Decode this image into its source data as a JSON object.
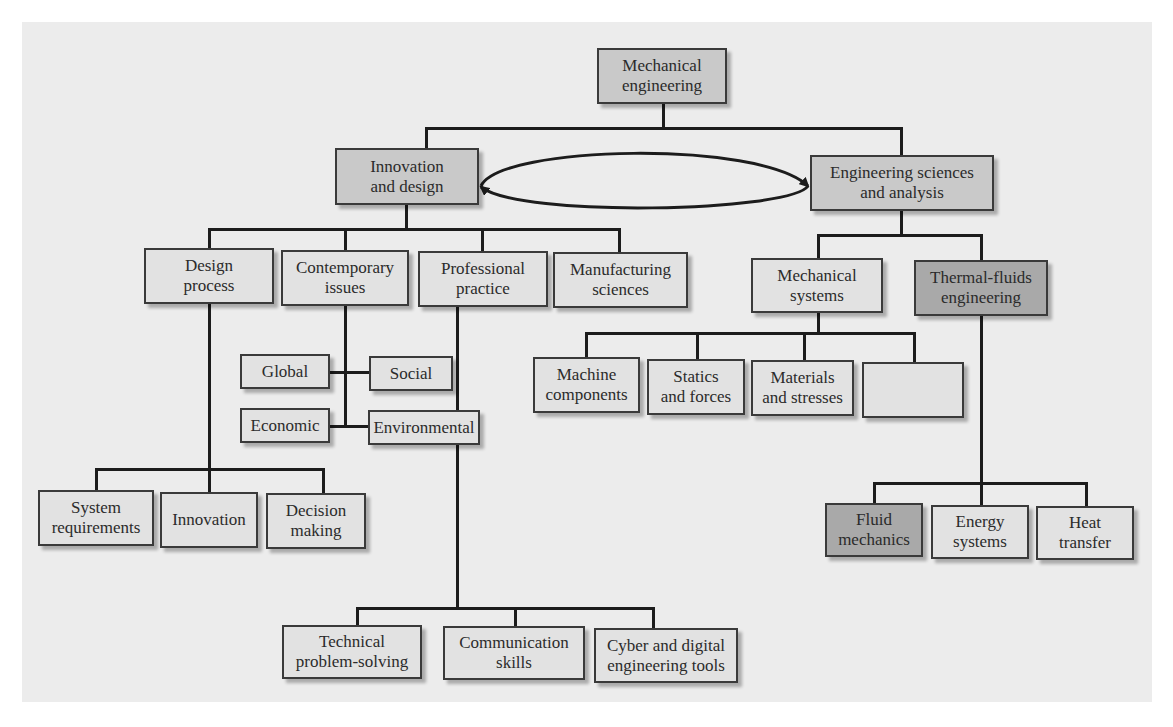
{
  "diagram": {
    "root": {
      "label": "Mechanical\nengineering"
    },
    "branches": {
      "innovation": {
        "label": "Innovation\nand design"
      },
      "sciences": {
        "label": "Engineering sciences\nand analysis"
      }
    },
    "innovation_children": {
      "design_process": {
        "label": "Design\nprocess"
      },
      "contemporary_issues": {
        "label": "Contemporary\nissues"
      },
      "professional_practice": {
        "label": "Professional\npractice"
      },
      "manufacturing_sciences": {
        "label": "Manufacturing\nsciences"
      }
    },
    "contemporary_children": {
      "global": {
        "label": "Global"
      },
      "social": {
        "label": "Social"
      },
      "economic": {
        "label": "Economic"
      },
      "environmental": {
        "label": "Environmental"
      }
    },
    "design_children": {
      "system_requirements": {
        "label": "System\nrequirements"
      },
      "innovation": {
        "label": "Innovation"
      },
      "decision_making": {
        "label": "Decision\nmaking"
      }
    },
    "professional_children": {
      "technical_problem_solving": {
        "label": "Technical\nproblem-solving"
      },
      "communication_skills": {
        "label": "Communication\nskills"
      },
      "cyber_digital_tools": {
        "label": "Cyber and digital\nengineering tools"
      }
    },
    "sciences_children": {
      "mechanical_systems": {
        "label": "Mechanical\nsystems"
      },
      "thermal_fluids": {
        "label": "Thermal-fluids\nengineering"
      }
    },
    "mechanical_systems_children": {
      "machine_components": {
        "label": "Machine\ncomponents"
      },
      "statics_forces": {
        "label": "Statics\nand forces"
      },
      "materials_stresses": {
        "label": "Materials\nand stresses"
      },
      "motion_dynamics": {
        "label": "Motion and\ndynamics"
      }
    },
    "thermal_children": {
      "fluid_mechanics": {
        "label": "Fluid\nmechanics"
      },
      "energy_systems": {
        "label": "Energy\nsystems"
      },
      "heat_transfer": {
        "label": "Heat\ntransfer"
      }
    },
    "colors": {
      "panel": "#ececec",
      "box_light": "#e2e2e2",
      "box_mid": "#c9c9c9",
      "box_dark": "#a9a9a9",
      "line": "#1c1c1c"
    }
  }
}
